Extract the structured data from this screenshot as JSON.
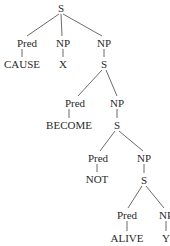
{
  "diagram": {
    "type": "syntax-tree",
    "nodes": [
      {
        "id": "s0",
        "label": "S",
        "x": 61,
        "y": 8
      },
      {
        "id": "pred1",
        "label": "Pred",
        "x": 27,
        "y": 43
      },
      {
        "id": "cause",
        "label": "CAUSE",
        "x": 22,
        "y": 64
      },
      {
        "id": "np1",
        "label": "NP",
        "x": 63,
        "y": 43
      },
      {
        "id": "x",
        "label": "X",
        "x": 63,
        "y": 64
      },
      {
        "id": "np2",
        "label": "NP",
        "x": 104,
        "y": 43
      },
      {
        "id": "s1",
        "label": "S",
        "x": 104,
        "y": 64
      },
      {
        "id": "pred2",
        "label": "Pred",
        "x": 75,
        "y": 103
      },
      {
        "id": "become",
        "label": "BECOME",
        "x": 69,
        "y": 125
      },
      {
        "id": "np3",
        "label": "NP",
        "x": 117,
        "y": 103
      },
      {
        "id": "s2",
        "label": "S",
        "x": 117,
        "y": 125
      },
      {
        "id": "pred3",
        "label": "Pred",
        "x": 98,
        "y": 158
      },
      {
        "id": "not",
        "label": "NOT",
        "x": 97,
        "y": 179
      },
      {
        "id": "np4",
        "label": "NP",
        "x": 144,
        "y": 158
      },
      {
        "id": "s3",
        "label": "S",
        "x": 144,
        "y": 180
      },
      {
        "id": "pred4",
        "label": "Pred",
        "x": 127,
        "y": 215
      },
      {
        "id": "alive",
        "label": "ALIVE",
        "x": 127,
        "y": 238
      },
      {
        "id": "np5",
        "label": "NP",
        "x": 166,
        "y": 215
      },
      {
        "id": "y",
        "label": "Y",
        "x": 166,
        "y": 238
      }
    ],
    "edges": [
      {
        "x1": 59,
        "y1": 14,
        "x2": 27,
        "y2": 36
      },
      {
        "x1": 61,
        "y1": 14,
        "x2": 62,
        "y2": 36
      },
      {
        "x1": 63,
        "y1": 14,
        "x2": 102,
        "y2": 36
      },
      {
        "x1": 22,
        "y1": 49,
        "x2": 22,
        "y2": 57
      },
      {
        "x1": 63,
        "y1": 49,
        "x2": 63,
        "y2": 57
      },
      {
        "x1": 104,
        "y1": 49,
        "x2": 104,
        "y2": 57
      },
      {
        "x1": 102,
        "y1": 70,
        "x2": 78,
        "y2": 96
      },
      {
        "x1": 106,
        "y1": 70,
        "x2": 117,
        "y2": 96
      },
      {
        "x1": 69,
        "y1": 109,
        "x2": 69,
        "y2": 118
      },
      {
        "x1": 117,
        "y1": 109,
        "x2": 117,
        "y2": 118
      },
      {
        "x1": 115,
        "y1": 131,
        "x2": 100,
        "y2": 151
      },
      {
        "x1": 119,
        "y1": 131,
        "x2": 143,
        "y2": 151
      },
      {
        "x1": 97,
        "y1": 164,
        "x2": 97,
        "y2": 172
      },
      {
        "x1": 144,
        "y1": 164,
        "x2": 144,
        "y2": 173
      },
      {
        "x1": 142,
        "y1": 186,
        "x2": 128,
        "y2": 208
      },
      {
        "x1": 146,
        "y1": 186,
        "x2": 164,
        "y2": 208
      },
      {
        "x1": 127,
        "y1": 221,
        "x2": 127,
        "y2": 231
      },
      {
        "x1": 166,
        "y1": 221,
        "x2": 166,
        "y2": 231
      }
    ]
  }
}
